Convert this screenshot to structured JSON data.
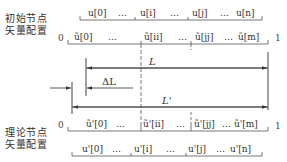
{
  "labels": {
    "initial": [
      "初始节点",
      "矢量配置"
    ],
    "theoretical": [
      "理论节点",
      "矢量配置"
    ]
  },
  "rows": {
    "u": [
      "u[0]",
      "…",
      "u[i]",
      "…",
      "u[j]",
      "…",
      "u[n]"
    ],
    "u_tilde": [
      "ũ[0]",
      "…",
      "ũ[ii]",
      "…",
      "ũ[jj]",
      "…",
      "ũ[m]"
    ],
    "u_tilde_prime": [
      "ũ'[0]",
      "…",
      "ũ'[ii]",
      "…",
      "ũ'[jj]",
      "…",
      "ũ'[m]"
    ],
    "u_prime": [
      "u'[0]",
      "…",
      "u'[i]",
      "…",
      "u'[j]",
      "…",
      "u'[n]"
    ]
  },
  "endpoints": {
    "start": "0",
    "end": "1"
  },
  "dimensions": {
    "L": "L",
    "delta_L": "ΔL",
    "L_prime": "L'"
  }
}
